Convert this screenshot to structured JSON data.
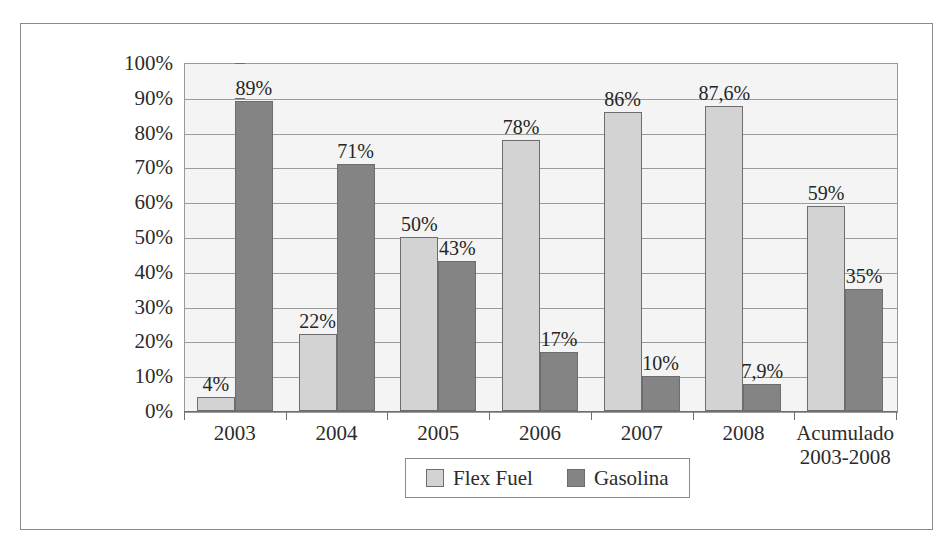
{
  "chart_data": {
    "type": "bar",
    "title": "",
    "subtitle": "",
    "xlabel": "",
    "ylabel": "",
    "ylim": [
      0,
      100
    ],
    "y_tick_labels": [
      "100%",
      "90%",
      "80%",
      "70%",
      "60%",
      "50%",
      "40%",
      "30%",
      "20%",
      "10%",
      "0%"
    ],
    "y_tick_values": [
      100,
      90,
      80,
      70,
      60,
      50,
      40,
      30,
      20,
      10,
      0
    ],
    "grid": "horizontal",
    "legend_position": "bottom-center",
    "categories": [
      "2003",
      "2004",
      "2005",
      "2006",
      "2007",
      "2008",
      "Acumulado\n2003-2008"
    ],
    "series": [
      {
        "name": "Flex Fuel",
        "color": "#d3d3d3",
        "values": [
          4,
          22,
          50,
          78,
          86,
          87.6,
          59
        ],
        "data_labels": [
          "4%",
          "22%",
          "50%",
          "78%",
          "86%",
          "87,6%",
          "59%"
        ]
      },
      {
        "name": "Gasolina",
        "color": "#848484",
        "values": [
          89,
          71,
          43,
          17,
          10,
          7.9,
          35
        ],
        "data_labels": [
          "89%",
          "71%",
          "43%",
          "17%",
          "10%",
          "7,9%",
          "35%"
        ]
      }
    ]
  },
  "legend": {
    "items": [
      {
        "label": "Flex Fuel",
        "color": "#d3d3d3"
      },
      {
        "label": "Gasolina",
        "color": "#848484"
      }
    ]
  },
  "colors": {
    "flex_fuel": "#d3d3d3",
    "gasolina": "#848484",
    "plot_background": "#f4f4f4",
    "gridline": "#9b9b9b",
    "frame_border": "#8a8a8a",
    "text": "#2b2b2b"
  }
}
